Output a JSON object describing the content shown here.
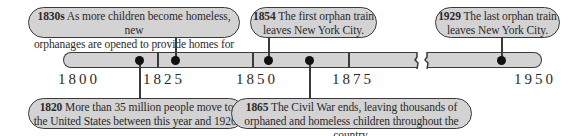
{
  "timeline": {
    "axis_labels": [
      "1800",
      "1825",
      "1850",
      "1875",
      "1950"
    ],
    "events": [
      {
        "year": "1830s",
        "text": "As more children become homeless, new",
        "text2": "orphanages are opened to provide homes for them."
      },
      {
        "year": "1854",
        "text": "The first orphan train",
        "text2": "leaves New York City."
      },
      {
        "year": "1929",
        "text": "The last orphan train",
        "text2": "leaves New York City."
      },
      {
        "year": "1820",
        "text": "More than 35 million people move to",
        "text2": "the United States between this year and 1920."
      },
      {
        "year": "1865",
        "text": "The Civil War ends, leaving thousands of",
        "text2": "orphaned and homeless children throughout the country."
      }
    ],
    "colors": {
      "bar": "#d3d3d3",
      "outline": "#3a3a3a",
      "dot": "#111111"
    }
  }
}
